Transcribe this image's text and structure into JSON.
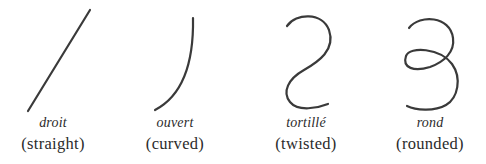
{
  "figure": {
    "stroke_color": "#3a3a3a",
    "items": [
      {
        "shape": "straight-line",
        "term": "droit",
        "gloss": "(straight)"
      },
      {
        "shape": "curved-arc",
        "term": "ouvert",
        "gloss": "(curved)"
      },
      {
        "shape": "s-curve",
        "term": "tortillé",
        "gloss": "(twisted)"
      },
      {
        "shape": "loop-curve",
        "term": "rond",
        "gloss": "(rounded)"
      }
    ]
  }
}
